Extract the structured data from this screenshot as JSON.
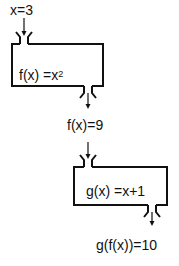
{
  "diagram": {
    "type": "function-machine-composition",
    "input": {
      "label": "x=3"
    },
    "machine1": {
      "function_name": "f(x)",
      "equals": "=x",
      "exponent": "2"
    },
    "intermediate": {
      "label": "f(x)=9"
    },
    "machine2": {
      "function_name": "g(x)",
      "equals": "=x+1"
    },
    "output": {
      "label": "g(f(x))=10"
    },
    "stroke_color": "#111111",
    "background": "#ffffff"
  }
}
